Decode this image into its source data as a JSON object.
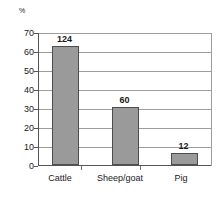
{
  "chart_data": {
    "type": "bar",
    "title": "",
    "subtitle": "",
    "xlabel": "",
    "ylabel": "%",
    "unit_label": "%",
    "categories": [
      "Cattle",
      "Sheep/goat",
      "Pig"
    ],
    "values": [
      63.0,
      30.7,
      6.5
    ],
    "data_labels": [
      "124",
      "60",
      "12"
    ],
    "data_label_note": "absolute counts printed above each bar",
    "ylim": [
      0,
      70
    ],
    "yticks": [
      0,
      10,
      20,
      30,
      40,
      50,
      60,
      70
    ],
    "ytick_labels": [
      "0",
      "10",
      "20",
      "30",
      "40",
      "50",
      "60",
      "70"
    ],
    "grid": true,
    "grid_axis": "y",
    "legend": false,
    "legend_position": "none",
    "series": [
      {
        "name": "",
        "values": [
          63.0,
          30.7,
          6.5
        ]
      }
    ],
    "colors": {
      "bar_fill": "#9a9a9a",
      "bar_edge": "#4d4d4d",
      "gridline": "#9d9d9d",
      "axis": "#555555",
      "background": "#ffffff",
      "text": "#1a1a1a"
    }
  }
}
